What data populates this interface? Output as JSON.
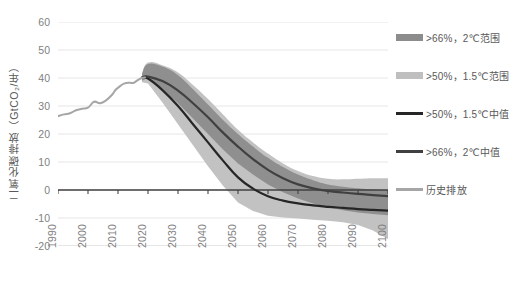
{
  "chart_data": {
    "type": "area",
    "title": "",
    "xlabel": "",
    "ylabel": "二氧化碳排放（GtCO₂/年）",
    "xlim": [
      1990,
      2100
    ],
    "ylim": [
      -20,
      60
    ],
    "grid": true,
    "legend_position": "right",
    "y_ticks": [
      "60",
      "50",
      "40",
      "30",
      "20",
      "10",
      "0",
      "-10",
      "-20"
    ],
    "y_tick_values": [
      60,
      50,
      40,
      30,
      20,
      10,
      0,
      -10,
      -20
    ],
    "x_ticks": [
      "1990",
      "2000",
      "2010",
      "2020",
      "2030",
      "2040",
      "2050",
      "2060",
      "2070",
      "2080",
      "2090",
      "2100"
    ],
    "x_tick_values": [
      1990,
      2000,
      2010,
      2020,
      2030,
      2040,
      2050,
      2060,
      2070,
      2080,
      2090,
      2100
    ],
    "colors": {
      "band_2c": "#8c8c8c",
      "band_15c": "#bfbfbf",
      "median_15c": "#262626",
      "median_2c": "#404040",
      "historical": "#a6a6a6",
      "grid": "#e6e6e6",
      "axis": "#404040",
      "text": "#7f7f7f"
    },
    "series": [
      {
        "name": ">66%, 2℃范围",
        "type": "band",
        "color": "#8c8c8c",
        "x": [
          2018,
          2020,
          2025,
          2030,
          2035,
          2040,
          2045,
          2050,
          2055,
          2060,
          2065,
          2070,
          2075,
          2080,
          2085,
          2090,
          2095,
          2100
        ],
        "upper": [
          41.5,
          45.0,
          44.0,
          41.0,
          36.0,
          30.5,
          25.0,
          20.0,
          15.5,
          11.5,
          8.2,
          5.5,
          3.5,
          2.0,
          1.2,
          0.6,
          0.2,
          0.0
        ],
        "lower": [
          39.0,
          40.0,
          36.0,
          31.0,
          25.5,
          20.0,
          14.5,
          9.5,
          5.5,
          2.0,
          -0.8,
          -3.0,
          -4.8,
          -6.2,
          -7.2,
          -8.0,
          -8.6,
          -9.0
        ]
      },
      {
        "name": ">50%, 1.5℃范围",
        "type": "band",
        "color": "#bfbfbf",
        "x": [
          2018,
          2020,
          2025,
          2030,
          2035,
          2040,
          2045,
          2050,
          2055,
          2060,
          2065,
          2070,
          2075,
          2080,
          2085,
          2090,
          2095,
          2100
        ],
        "upper": [
          41.5,
          45.5,
          44.5,
          42.0,
          37.5,
          32.5,
          27.0,
          21.5,
          17.0,
          13.0,
          9.5,
          6.8,
          5.0,
          4.0,
          3.8,
          4.0,
          4.2,
          4.2
        ],
        "lower": [
          38.5,
          38.0,
          31.0,
          23.5,
          16.0,
          8.5,
          1.5,
          -4.5,
          -7.5,
          -9.2,
          -9.8,
          -10.2,
          -10.6,
          -11.0,
          -11.5,
          -12.5,
          -14.5,
          -17.5
        ]
      },
      {
        "name": ">50%, 1.5℃中值",
        "type": "line",
        "color": "#262626",
        "x": [
          2018,
          2020,
          2025,
          2030,
          2035,
          2040,
          2045,
          2050,
          2055,
          2060,
          2065,
          2070,
          2075,
          2080,
          2085,
          2090,
          2095,
          2100
        ],
        "y": [
          40.0,
          39.8,
          35.5,
          30.0,
          23.5,
          17.0,
          10.5,
          4.5,
          0.5,
          -2.2,
          -3.8,
          -4.8,
          -5.5,
          -6.0,
          -6.4,
          -6.8,
          -7.1,
          -7.4
        ]
      },
      {
        "name": ">66%, 2℃中值",
        "type": "line",
        "color": "#404040",
        "x": [
          2018,
          2020,
          2025,
          2030,
          2035,
          2040,
          2045,
          2050,
          2055,
          2060,
          2065,
          2070,
          2075,
          2080,
          2085,
          2090,
          2095,
          2100
        ],
        "y": [
          40.2,
          40.5,
          38.8,
          35.5,
          31.0,
          26.0,
          20.5,
          15.5,
          11.0,
          7.2,
          4.2,
          2.0,
          0.6,
          -0.3,
          -0.9,
          -1.4,
          -1.8,
          -2.2
        ]
      },
      {
        "name": "历史排放",
        "type": "line",
        "color": "#a6a6a6",
        "x": [
          1990,
          1992,
          1994,
          1996,
          1998,
          2000,
          2002,
          2004,
          2006,
          2008,
          2009,
          2010,
          2012,
          2014,
          2015,
          2016,
          2017,
          2018,
          2019
        ],
        "y": [
          26.4,
          27.0,
          27.4,
          28.5,
          29.0,
          29.4,
          31.5,
          31.0,
          32.0,
          34.0,
          35.5,
          36.5,
          38.0,
          38.3,
          38.2,
          38.8,
          39.5,
          40.0,
          40.2
        ]
      }
    ]
  },
  "legend": {
    "items": [
      {
        "label": ">66%，2℃范围",
        "style": "band",
        "color": "#8c8c8c",
        "top": 12
      },
      {
        "label": ">50%，1.5℃范围",
        "style": "band",
        "color": "#bfbfbf",
        "top": 50
      },
      {
        "label": ">50%，1.5℃中值",
        "style": "line-thick",
        "color": "#262626",
        "top": 88
      },
      {
        "label": ">66%，2℃中值",
        "style": "line-thick",
        "color": "#404040",
        "top": 126
      },
      {
        "label": "历史排放",
        "style": "line",
        "color": "#a6a6a6",
        "top": 164
      }
    ]
  }
}
